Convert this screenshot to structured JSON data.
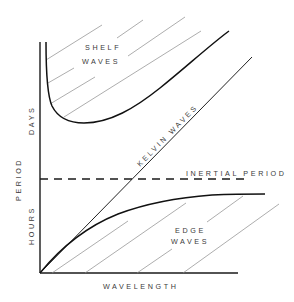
{
  "figure": {
    "type": "dispersion-diagram",
    "x_axis": {
      "label": "WAVELENGTH"
    },
    "y_axis": {
      "label": "PERIOD",
      "upper_label": "DAYS",
      "lower_label": "HOURS"
    },
    "regions": [
      {
        "name": "shelf-waves",
        "label_line1": "SHELF",
        "label_line2": "WAVES"
      },
      {
        "name": "edge-waves",
        "label_line1": "EDGE",
        "label_line2": "WAVES"
      }
    ],
    "lines": {
      "kelvin": {
        "label": "KELVIN WAVES"
      },
      "inertial": {
        "label": "INERTIAL PERIOD",
        "style": "dashed"
      }
    }
  },
  "colors": {
    "background": "#ffffff",
    "ink": "#111111",
    "hatch": "#8a8a8a"
  }
}
